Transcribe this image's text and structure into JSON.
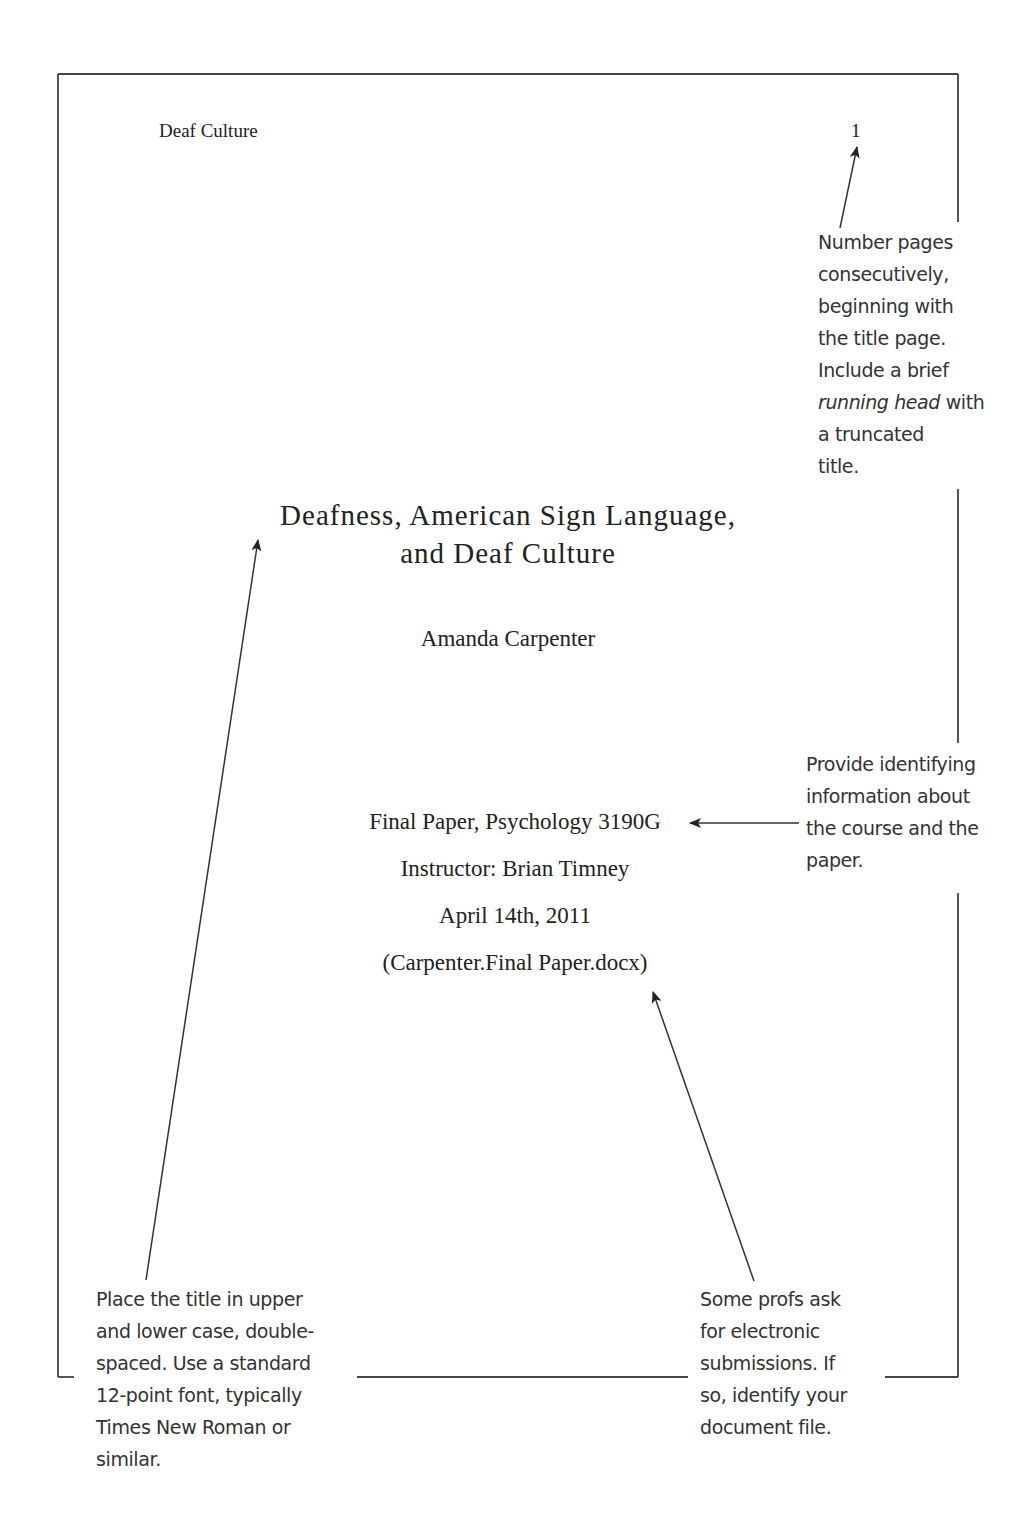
{
  "page": {
    "running_head": "Deaf Culture",
    "page_number": "1",
    "title_lines": [
      "Deafness, American Sign Language,",
      "and Deaf Culture"
    ],
    "author": "Amanda Carpenter",
    "course_info": [
      "Final Paper, Psychology 3190G",
      "Instructor: Brian Timney",
      "April 14th, 2011",
      "(Carpenter.Final Paper.docx)"
    ]
  },
  "annotations": {
    "page_numbering": {
      "lines": [
        "Number pages",
        "consecutively,",
        "beginning with",
        "the title page.",
        "Include a brief"
      ],
      "italic_phrase": "running head",
      "after_italic": " with",
      "tail_lines": [
        "a truncated",
        "title."
      ]
    },
    "course_info_note": {
      "lines": [
        "Provide identifying",
        "information about",
        "the course and the",
        "paper."
      ]
    },
    "title_format_note": {
      "lines": [
        "Place the title in upper",
        "and lower case, double-",
        "spaced. Use a standard",
        "12-point font, typically",
        "Times New Roman or",
        "similar."
      ]
    },
    "electronic_file_note": {
      "lines": [
        "Some profs ask",
        "for electronic",
        "submissions. If",
        "so, identify your",
        "document file."
      ]
    }
  },
  "colors": {
    "border": "#444444",
    "arrow": "#333333",
    "text": "#222222"
  }
}
